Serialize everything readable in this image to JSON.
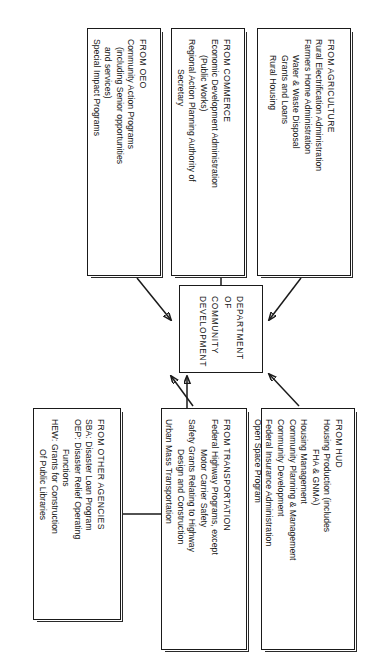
{
  "diagram": {
    "title": "DEPARTMENT OF COMMUNITY DEVELOPMENT",
    "center": {
      "line1": "DEPARTMENT",
      "line2": "OF",
      "line3": "COMMUNITY",
      "line4": "DEVELOPMENT"
    },
    "sources": [
      {
        "id": "agriculture",
        "header": "FROM AGRICULTURE",
        "items": [
          {
            "text": "Rural Electrification Administration",
            "indent": 0
          },
          {
            "text": "Farmers Home Administration",
            "indent": 0
          },
          {
            "text": "Water & Waste Disposal",
            "indent": 1
          },
          {
            "text": "Grants and Loans",
            "indent": 1
          },
          {
            "text": "Rural Housing",
            "indent": 1
          }
        ]
      },
      {
        "id": "commerce",
        "header": "FROM COMMERCE",
        "items": [
          {
            "text": "Economic Development Administration",
            "indent": 0
          },
          {
            "text": "(Public Works)",
            "indent": 1
          },
          {
            "text": "Regional Action Planning Authority of",
            "indent": 0
          },
          {
            "text": "Secretary",
            "indent": 2
          }
        ]
      },
      {
        "id": "oeo",
        "header": "FROM OEO",
        "items": [
          {
            "text": "Community Action Programs",
            "indent": 0
          },
          {
            "text": "(including Senior opportunities",
            "indent": 1
          },
          {
            "text": "and services)",
            "indent": 1
          },
          {
            "text": "Special Impact Programs",
            "indent": 0
          }
        ]
      },
      {
        "id": "hud",
        "header": "FROM HUD",
        "items": [
          {
            "text": "Housing Production (includes",
            "indent": 0
          },
          {
            "text": "FHA & GNMA)",
            "indent": 2
          },
          {
            "text": "Housing Management",
            "indent": 0
          },
          {
            "text": "Community Planning & Management",
            "indent": 0
          },
          {
            "text": "Community Development",
            "indent": 0
          },
          {
            "text": "Federal Insurance Administration",
            "indent": 0
          },
          {
            "text": "Open Space Program",
            "indent": 0
          }
        ]
      },
      {
        "id": "transportation",
        "header": "FROM TRANSPORTATION",
        "items": [
          {
            "text": "Federal Highway Programs, except",
            "indent": 0
          },
          {
            "text": "Motor Carrier Safety",
            "indent": 1
          },
          {
            "text": "Safety Grants Relating to Highway",
            "indent": 0
          },
          {
            "text": "Design and Construction",
            "indent": 1
          },
          {
            "text": "Urban Mass Transportation",
            "indent": 0
          }
        ]
      },
      {
        "id": "other-agencies",
        "header": "FROM OTHER AGENCIES",
        "items": [
          {
            "text": "SBA:  Disaster Loan Program",
            "indent": 0
          },
          {
            "text": "OEP:  Disaster Relief Operating",
            "indent": 0
          },
          {
            "text": "Functions",
            "indent": 2
          },
          {
            "text": "HEW:  Grants for Construction",
            "indent": 0
          },
          {
            "text": "Of Public Libraries",
            "indent": 2
          }
        ]
      }
    ],
    "connectors": [
      {
        "from": "agriculture",
        "to": "center",
        "style": "arrow"
      },
      {
        "from": "commerce",
        "to": "center",
        "style": "arrow"
      },
      {
        "from": "oeo",
        "to": "center",
        "style": "arrow"
      },
      {
        "from": "hud",
        "to": "center",
        "style": "arrow"
      },
      {
        "from": "transportation",
        "to": "center",
        "style": "arrow"
      },
      {
        "from": "other-agencies",
        "to": "center",
        "style": "arrow"
      }
    ],
    "colors": {
      "ink": "#1a1a1a",
      "paper": "#ffffff"
    }
  }
}
